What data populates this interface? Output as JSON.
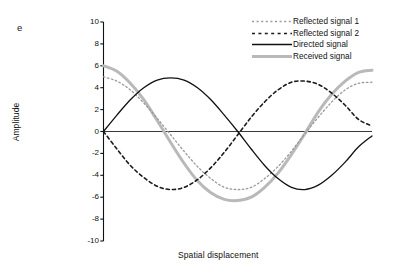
{
  "panel": {
    "label": "e"
  },
  "axes": {
    "ylabel": "Amplitude",
    "xlabel": "Spatial displacement",
    "yticks": [
      "10",
      "8",
      "6",
      "4",
      "2",
      "0",
      "-2",
      "-4",
      "-6",
      "-8",
      "-10"
    ]
  },
  "legend": {
    "items": [
      {
        "label": "Reflected signal 1",
        "style": "dotted-light",
        "color": "#9a9a9a"
      },
      {
        "label": "Reflected signal 2",
        "style": "dashed-dark",
        "color": "#1a1a1a"
      },
      {
        "label": "Directed signal",
        "style": "solid-black",
        "color": "#111111"
      },
      {
        "label": "Received signal",
        "style": "solid-thick-gray",
        "color": "#b9b9b9"
      }
    ]
  },
  "chart_data": {
    "type": "line",
    "title": "",
    "subtitle": "",
    "xlabel": "Spatial displacement",
    "ylabel": "Amplitude",
    "xlim": [
      0,
      1
    ],
    "ylim": [
      -10,
      10
    ],
    "ytick_values": [
      10,
      8,
      6,
      4,
      2,
      0,
      -2,
      -4,
      -6,
      -8,
      -10
    ],
    "xtick_values": [],
    "grid": false,
    "legend_position": "top-right",
    "annotations": [
      {
        "text": "e",
        "position": "top-left"
      }
    ],
    "x": [
      0,
      0.05,
      0.1,
      0.15,
      0.2,
      0.25,
      0.3,
      0.35,
      0.4,
      0.45,
      0.5,
      0.55,
      0.6,
      0.65,
      0.7,
      0.75,
      0.8,
      0.85,
      0.9,
      0.95,
      1.0
    ],
    "series": [
      {
        "name": "Reflected signal 1",
        "color": "#9a9a9a",
        "linestyle": "dotted",
        "linewidth": 1.3,
        "amplitude": 5.3,
        "values": [
          5.0,
          4.6,
          3.8,
          2.6,
          1.2,
          -0.3,
          -1.8,
          -3.2,
          -4.3,
          -5.1,
          -5.3,
          -5.1,
          -4.3,
          -3.2,
          -1.8,
          -0.2,
          1.3,
          2.7,
          3.8,
          4.4,
          4.5
        ]
      },
      {
        "name": "Reflected signal 2",
        "color": "#1a1a1a",
        "linestyle": "dashed",
        "linewidth": 1.6,
        "amplitude": 5.3,
        "values": [
          0.0,
          -1.6,
          -3.1,
          -4.2,
          -5.0,
          -5.3,
          -5.1,
          -4.4,
          -3.3,
          -1.9,
          -0.3,
          1.3,
          2.7,
          3.8,
          4.5,
          4.6,
          4.3,
          3.5,
          2.4,
          1.1,
          0.5
        ]
      },
      {
        "name": "Directed signal",
        "color": "#111111",
        "linestyle": "solid",
        "linewidth": 1.3,
        "amplitude": 5.0,
        "values": [
          0.0,
          1.5,
          2.9,
          4.0,
          4.7,
          4.9,
          4.7,
          4.0,
          2.9,
          1.5,
          0.0,
          -1.6,
          -3.1,
          -4.3,
          -5.1,
          -5.3,
          -4.9,
          -4.0,
          -2.8,
          -1.4,
          -0.4
        ]
      },
      {
        "name": "Received signal",
        "color": "#b9b9b9",
        "linestyle": "solid",
        "linewidth": 3.0,
        "amplitude": 6.3,
        "values": [
          6.0,
          5.5,
          4.4,
          2.9,
          1.0,
          -1.0,
          -2.9,
          -4.5,
          -5.6,
          -6.2,
          -6.3,
          -6.0,
          -5.1,
          -3.8,
          -2.1,
          -0.2,
          1.8,
          3.4,
          4.6,
          5.4,
          5.6
        ]
      }
    ]
  }
}
